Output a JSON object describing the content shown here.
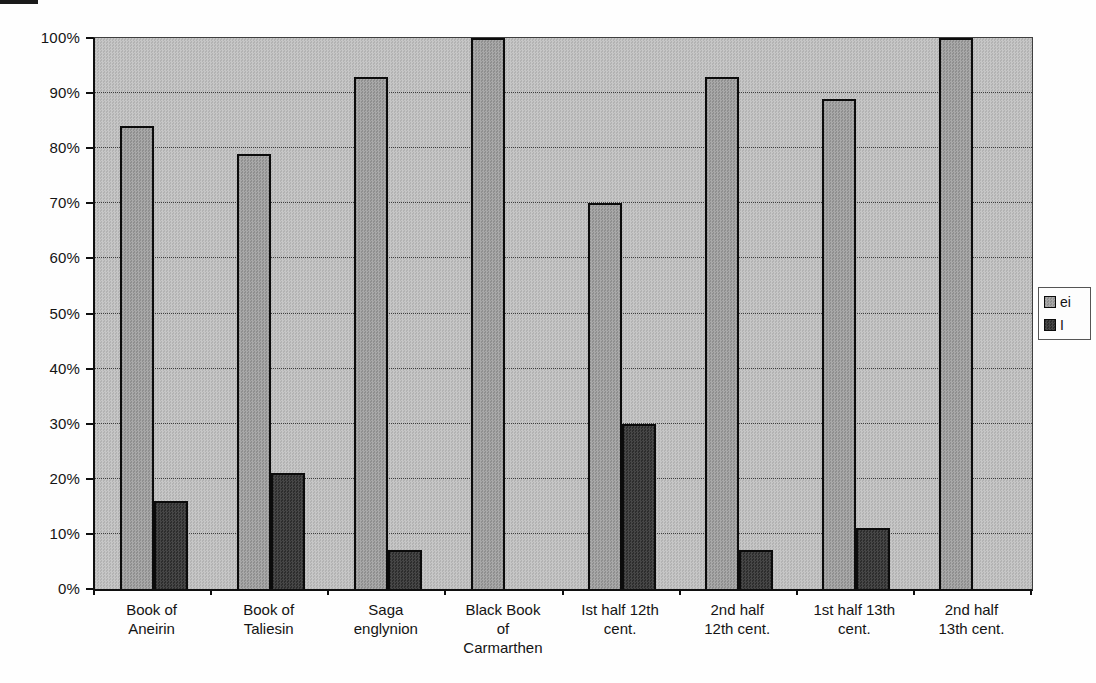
{
  "chart_data": {
    "type": "bar",
    "categories": [
      [
        "Book of",
        "Aneirin"
      ],
      [
        "Book of",
        "Taliesin"
      ],
      [
        "Saga",
        "englynion"
      ],
      [
        "Black Book",
        "of",
        "Carmarthen"
      ],
      [
        "Ist half 12th",
        "cent."
      ],
      [
        "2nd half",
        "12th cent."
      ],
      [
        "1st half 13th",
        "cent."
      ],
      [
        "2nd half",
        "13th cent."
      ]
    ],
    "series": [
      {
        "name": "ei",
        "color": "#9c9c9c",
        "values": [
          84,
          79,
          93,
          100,
          70,
          93,
          89,
          100
        ]
      },
      {
        "name": "I",
        "color": "#3a3a3a",
        "values": [
          16,
          21,
          7,
          0,
          30,
          7,
          11,
          0
        ]
      }
    ],
    "title": "",
    "xlabel": "",
    "ylabel": "",
    "ylim": [
      0,
      100
    ],
    "y_ticks": [
      "0%",
      "10%",
      "20%",
      "30%",
      "40%",
      "50%",
      "60%",
      "70%",
      "80%",
      "90%",
      "100%"
    ],
    "grid": true,
    "legend_position": "right",
    "plot_background": "#bdbdbd",
    "grid_color": "#3e3e3e"
  }
}
